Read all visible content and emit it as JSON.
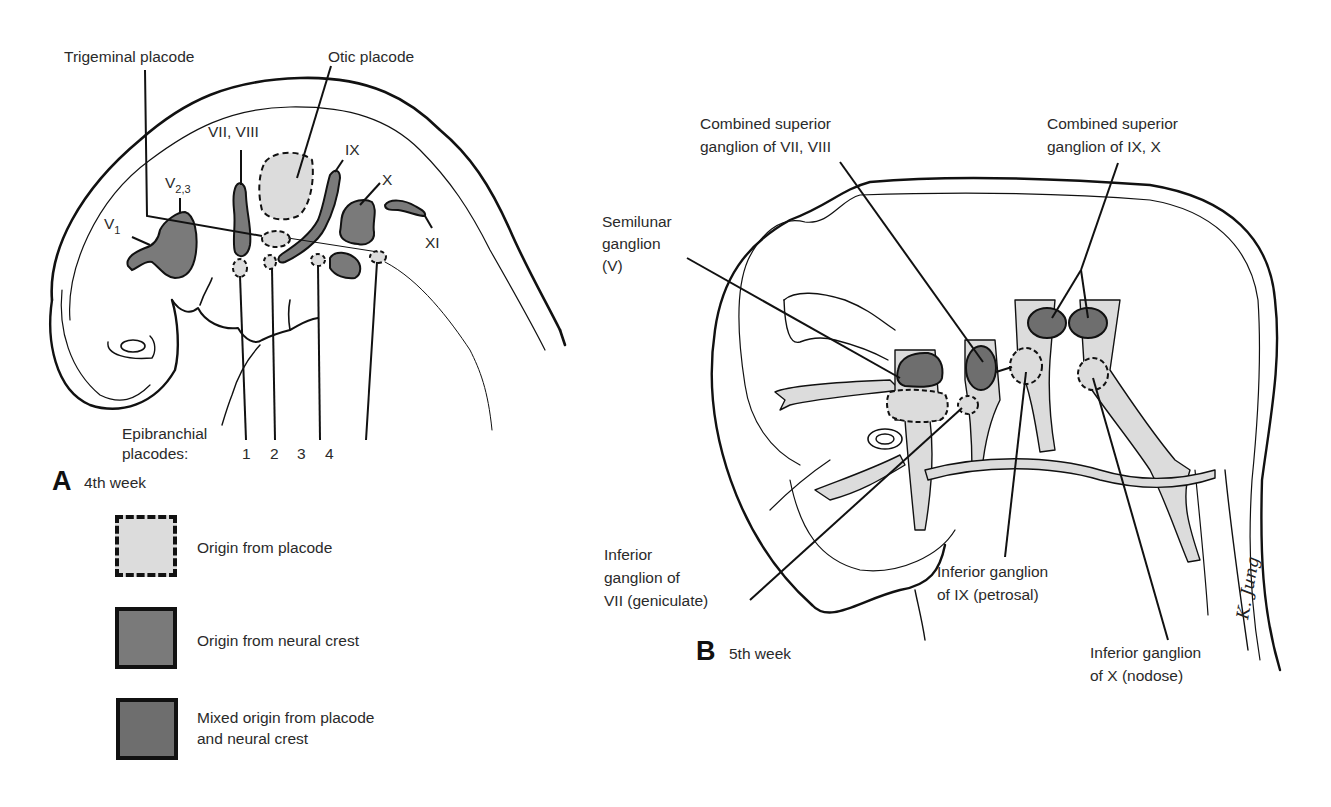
{
  "colors": {
    "placode_fill": "#dcdcdc",
    "neural_crest_fill": "#7a7a7a",
    "mixed_fill": "#6e6e6e",
    "outline": "#111111",
    "background": "#ffffff"
  },
  "panel_a": {
    "letter": "A",
    "caption": "4th week",
    "labels": {
      "trigeminal_placode": "Trigeminal placode",
      "otic_placode": "Otic placode",
      "v1_main": "V",
      "v1_sub": "1",
      "v23_main": "V",
      "v23_sub": "2,3",
      "vii_viii": "VII, VIII",
      "ix": "IX",
      "x": "X",
      "xi": "XI",
      "epibranchial_line1": "Epibranchial",
      "epibranchial_line2": "placodes:",
      "epi_numbers": [
        "1",
        "2",
        "3",
        "4"
      ]
    }
  },
  "legend": {
    "items": [
      {
        "label_line1": "Origin from placode",
        "label_line2": "",
        "style": "dashed-light"
      },
      {
        "label_line1": "Origin from neural crest",
        "label_line2": "",
        "style": "solid-dark"
      },
      {
        "label_line1": "Mixed origin from placode",
        "label_line2": "and neural crest",
        "style": "solid-darker"
      }
    ]
  },
  "panel_b": {
    "letter": "B",
    "caption": "5th week",
    "labels": {
      "combined_vii_viii_l1": "Combined superior",
      "combined_vii_viii_l2": "ganglion of VII, VIII",
      "combined_ix_x_l1": "Combined superior",
      "combined_ix_x_l2": "ganglion of IX, X",
      "semilunar_l1": "Semilunar",
      "semilunar_l2": "ganglion",
      "semilunar_l3": "(V)",
      "inferior_vii_l1": "Inferior",
      "inferior_vii_l2": "ganglion of",
      "inferior_vii_l3": "VII (geniculate)",
      "inferior_ix_l1": "Inferior ganglion",
      "inferior_ix_l2": "of IX (petrosal)",
      "inferior_x_l1": "Inferior ganglion",
      "inferior_x_l2": "of X (nodose)",
      "signature": "K. Jung"
    }
  }
}
